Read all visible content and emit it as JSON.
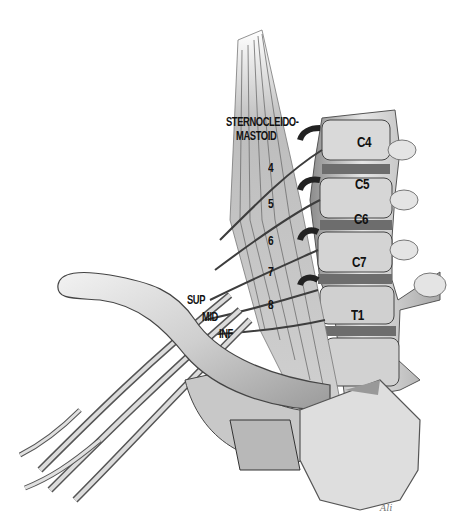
{
  "figure": {
    "type": "anatomical-illustration",
    "palette": {
      "background": "#ffffff",
      "ink": "#111111",
      "mid": "#8a8a8a",
      "light": "#d8d8d8"
    }
  },
  "labels": {
    "muscle_title_line1": "STERNOCLEIDO-",
    "muscle_title_line2": "MASTOID",
    "vertebrae": [
      "C4",
      "C5",
      "C6",
      "C7",
      "T1"
    ],
    "nerve_roots": [
      "4",
      "5",
      "6",
      "7",
      "8"
    ],
    "scalenes": [
      "SUP",
      "MID",
      "INF"
    ]
  },
  "signature": "Ali"
}
